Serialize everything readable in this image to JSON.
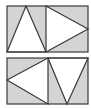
{
  "colors": {
    "background": "#ffffff",
    "fill_gray": "#d4d4d4",
    "fill_white": "#ffffff",
    "stroke": "#3a3a3a"
  },
  "panels": [
    {
      "name": "top-panel",
      "rect": {
        "x": 7,
        "y": 6,
        "w": 81,
        "h": 46
      },
      "divider_x": 46,
      "triangles": [
        {
          "name": "triangle-up",
          "points": "7,52 26,6 46,52"
        },
        {
          "name": "triangle-right",
          "points": "46,6 88,29 46,52"
        }
      ]
    },
    {
      "name": "bottom-panel",
      "rect": {
        "x": 7,
        "y": 58,
        "w": 81,
        "h": 46
      },
      "divider_x": 48,
      "triangles": [
        {
          "name": "triangle-left",
          "points": "48,58 7,80 48,104"
        },
        {
          "name": "triangle-down",
          "points": "48,58 88,58 67,104"
        }
      ]
    }
  ]
}
